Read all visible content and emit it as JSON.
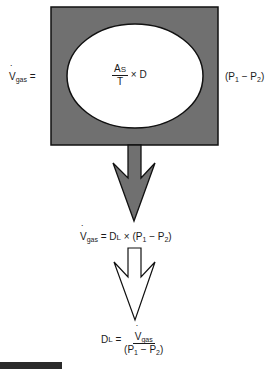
{
  "diagram": {
    "top_equation": {
      "lhs_symbol": "V",
      "lhs_subscript": "gas",
      "equals": "=",
      "inner_fraction_numerator_main": "A",
      "inner_fraction_numerator_small": "S",
      "inner_fraction_denominator": "T",
      "times_d": "× D",
      "pressure_term": "(P",
      "p1_sub": "1",
      "minus": " − P",
      "p2_sub": "2",
      "close_paren": ")"
    },
    "middle_equation": {
      "lhs_symbol": "V",
      "lhs_subscript": "gas",
      "rhs_main": " = D",
      "rhs_small": "L",
      "rhs_rest": " × (P",
      "p1_sub": "1",
      "minus": " − P",
      "p2_sub": "2",
      "close_paren": ")"
    },
    "bottom_equation": {
      "lhs_main": "D",
      "lhs_small": "L",
      "equals": " = ",
      "numerator_symbol": "V",
      "numerator_subscript": "gas",
      "denominator_open": "(P",
      "p1_sub": "1",
      "minus": " − P",
      "p2_sub": "2",
      "close_paren": ")"
    },
    "colors": {
      "box_fill": "#707070",
      "outline": "#111111",
      "ellipse_fill": "#ffffff",
      "open_arrow_fill": "#ffffff"
    }
  }
}
